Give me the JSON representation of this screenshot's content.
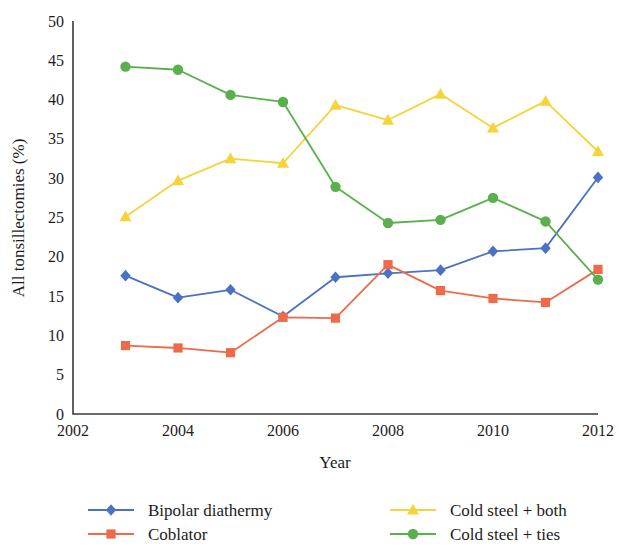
{
  "chart_data": {
    "type": "line",
    "title": "",
    "xlabel": "Year",
    "ylabel": "All tonsillectomies (%)",
    "xlim": [
      2002,
      2012
    ],
    "ylim": [
      0,
      50
    ],
    "x_ticks": [
      2002,
      2004,
      2006,
      2008,
      2010,
      2012
    ],
    "y_ticks": [
      0,
      5,
      10,
      15,
      20,
      25,
      30,
      35,
      40,
      45,
      50
    ],
    "grid": false,
    "legend_position": "bottom",
    "x": [
      2003,
      2004,
      2005,
      2006,
      2007,
      2008,
      2009,
      2010,
      2011,
      2012
    ],
    "series": [
      {
        "name": "Bipolar diathermy",
        "color": "#4a72c4",
        "marker": "diamond",
        "values": [
          17.6,
          14.8,
          15.8,
          12.4,
          17.4,
          17.9,
          18.3,
          20.7,
          21.1,
          30.1
        ]
      },
      {
        "name": "Coblator",
        "color": "#ed6a4a",
        "marker": "square",
        "values": [
          8.7,
          8.4,
          7.8,
          12.3,
          12.2,
          19.0,
          15.7,
          14.7,
          14.2,
          18.4
        ]
      },
      {
        "name": "Cold steel + both",
        "color": "#f5d33a",
        "marker": "triangle",
        "values": [
          25.1,
          29.7,
          32.5,
          31.9,
          39.3,
          37.4,
          40.7,
          36.4,
          39.8,
          33.4
        ]
      },
      {
        "name": "Cold steel + ties",
        "color": "#5bb04e",
        "marker": "circle",
        "values": [
          44.2,
          43.8,
          40.6,
          39.7,
          28.9,
          24.3,
          24.7,
          27.5,
          24.5,
          17.1
        ]
      }
    ]
  },
  "legend": {
    "entries": [
      {
        "label": "Bipolar diathermy"
      },
      {
        "label": "Coblator"
      },
      {
        "label": "Cold steel + both"
      },
      {
        "label": "Cold steel + ties"
      }
    ]
  },
  "axes": {
    "x_title": "Year",
    "y_title": "All tonsillectomies (%)",
    "x_tick_labels": [
      "2002",
      "2004",
      "2006",
      "2008",
      "2010",
      "2012"
    ],
    "y_tick_labels": [
      "0",
      "5",
      "10",
      "15",
      "20",
      "25",
      "30",
      "35",
      "40",
      "45",
      "50"
    ]
  }
}
